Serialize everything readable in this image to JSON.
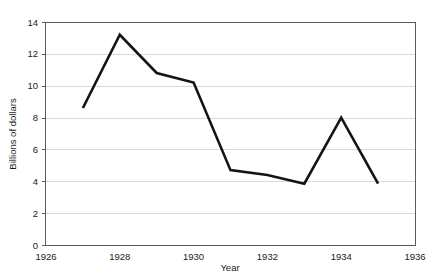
{
  "chart_data": {
    "type": "line",
    "title": "",
    "xlabel": "Year",
    "ylabel": "Billions of dollars",
    "x": [
      1927,
      1928,
      1929,
      1930,
      1931,
      1932,
      1933,
      1934,
      1935
    ],
    "values": [
      8.6,
      13.2,
      10.8,
      10.2,
      4.7,
      4.4,
      3.85,
      8.0,
      3.85
    ],
    "series": [
      {
        "name": "Billions of dollars",
        "values": [
          8.6,
          13.2,
          10.8,
          10.2,
          4.7,
          4.4,
          3.85,
          8.0,
          3.85
        ]
      }
    ],
    "xlim": [
      1926,
      1936
    ],
    "ylim": [
      0,
      14
    ],
    "xticks": [
      1926,
      1928,
      1930,
      1932,
      1934,
      1936
    ],
    "xtick_labels": [
      "1926",
      "1928",
      "1930",
      "1932",
      "1934",
      "1936"
    ],
    "yticks": [
      0,
      2,
      4,
      6,
      8,
      10,
      12,
      14
    ],
    "ytick_labels": [
      "0",
      "2",
      "4",
      "6",
      "8",
      "10",
      "12",
      "14"
    ],
    "grid": "horizontal",
    "legend": "none",
    "line_color": "#141414",
    "grid_color": "#d9d9d9",
    "frame_color": "#5a5a5a",
    "background": "#ffffff"
  }
}
